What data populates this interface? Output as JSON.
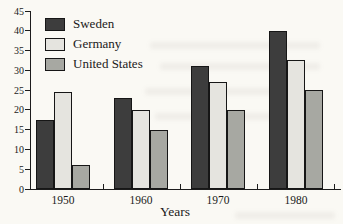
{
  "page": {
    "background_color": "#faf9f4"
  },
  "chart_data": {
    "type": "bar",
    "title_partial": "Tax Percent",
    "title_cut_off_at_top": true,
    "categories": [
      "1950",
      "1960",
      "1970",
      "1980"
    ],
    "series": [
      {
        "name": "Sweden",
        "color": "#3d3d3d",
        "values": [
          17.5,
          23,
          31,
          40
        ]
      },
      {
        "name": "Germany",
        "color": "#e5e4df",
        "values": [
          24.5,
          20,
          27,
          32.5
        ]
      },
      {
        "name": "United States",
        "color": "#a7a8a2",
        "values": [
          6,
          15,
          20,
          25
        ]
      }
    ],
    "xlabel": "Years",
    "ylabel": "",
    "ylim": [
      0,
      45
    ],
    "yticks": [
      0,
      5,
      10,
      15,
      20,
      25,
      30,
      35,
      40,
      45
    ],
    "grid": false,
    "legend_position": "top-left",
    "axis_color": "#1c1c1c"
  }
}
